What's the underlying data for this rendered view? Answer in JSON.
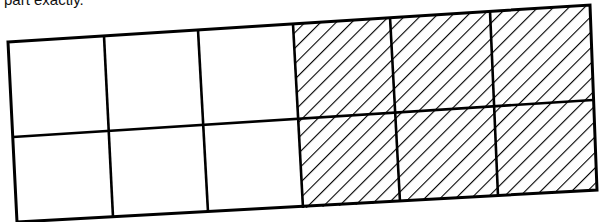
{
  "caption": "part exactly.",
  "figure": {
    "rows": 2,
    "columns": 6,
    "total_parts": 12,
    "shaded_parts": 6,
    "unshaded_parts": 6,
    "shaded_columns": [
      4,
      5,
      6
    ],
    "stroke_color": "#000000",
    "fill_color": "#ffffff"
  }
}
